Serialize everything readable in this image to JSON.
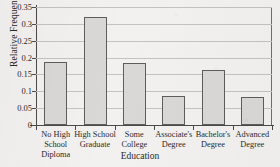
{
  "chart_data": {
    "type": "bar",
    "title": "",
    "xlabel": "Education",
    "ylabel": "Relative Frequency",
    "categories": [
      "No High School Diploma",
      "High School Graduate",
      "Some College",
      "Associate's Degree",
      "Bachelor's Degree",
      "Advanced Degree"
    ],
    "category_lines": [
      [
        "No High",
        "School",
        "Diploma"
      ],
      [
        "High School",
        "Graduate"
      ],
      [
        "Some",
        "College"
      ],
      [
        "Associate's",
        "Degree"
      ],
      [
        "Bachelor's",
        "Degree"
      ],
      [
        "Advanced",
        "Degree"
      ]
    ],
    "values": [
      0.186,
      0.32,
      0.183,
      0.085,
      0.162,
      0.082
    ],
    "ylim": [
      0,
      0.35
    ],
    "yticks": [
      0,
      0.05,
      0.1,
      0.15,
      0.2,
      0.25,
      0.3,
      0.35
    ],
    "ytick_labels": [
      "0",
      "0.05",
      "0.1",
      "0.15",
      "0.2",
      "0.25",
      "0.3",
      "0.35"
    ],
    "grid": true,
    "legend": "none",
    "bar_fill": "#d9d8d6",
    "bar_edge": "#5d5d5d",
    "axis_color": "#4a4a4a",
    "grid_color": "#c3c3c1",
    "background": "#f2f1ef"
  }
}
